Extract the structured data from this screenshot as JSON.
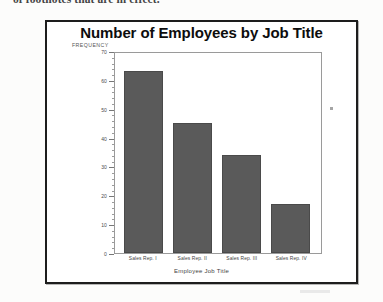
{
  "document": {
    "cut_off_line": "of footnotes that are in effect."
  },
  "chart_data": {
    "type": "bar",
    "title": "Number of Employees by Job Title",
    "xlabel": "Employee Job Title",
    "ylabel": "FREQUENCY",
    "categories": [
      "Sales Rep. I",
      "Sales Rep. II",
      "Sales Rep. III",
      "Sales Rep. IV"
    ],
    "values": [
      63,
      45,
      34,
      17
    ],
    "ylim": [
      0,
      70
    ],
    "ytick_labels": [
      "0",
      "10",
      "20",
      "30",
      "40",
      "50",
      "60",
      "70"
    ],
    "ytick_values": [
      0,
      10,
      20,
      30,
      40,
      50,
      60,
      70
    ],
    "yminor_step": 2,
    "grid": false,
    "legend": false,
    "bar_color": "#5a5a5a",
    "plot_border_color": "#9a9a9a",
    "frame_color": "#1d1d1d"
  }
}
